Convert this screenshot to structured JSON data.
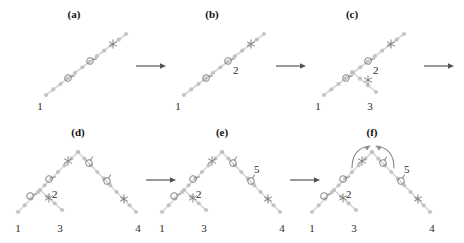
{
  "figure": {
    "title_visible": false,
    "background_color": "#ffffff",
    "branch_color": "#c9c9c9",
    "node_color": "#bdbdbd",
    "glyph_color": "#888888",
    "text_color": "#2a2a2a",
    "arrow_color": "#555555",
    "width": 464,
    "height": 243
  },
  "panels": [
    {
      "id": "a",
      "label": "(a)",
      "label_x": 74,
      "label_y": 8,
      "leaf_labels": [
        {
          "text": "1",
          "x": 40,
          "y": 100
        }
      ],
      "node_labels": [],
      "branches": [
        {
          "name": "trunk",
          "x1": 46,
          "y1": 95,
          "x2": 126,
          "y2": 34
        }
      ],
      "glyphs": [
        {
          "type": "circle-tail-glyph",
          "x": 68,
          "y": 78,
          "rot": 20
        },
        {
          "type": "circle-tail-glyph",
          "x": 90,
          "y": 61,
          "rot": 20
        },
        {
          "type": "star-glyph",
          "x": 113,
          "y": 44
        }
      ],
      "curved_arrows": []
    },
    {
      "id": "b",
      "label": "(b)",
      "label_x": 212,
      "label_y": 8,
      "leaf_labels": [
        {
          "text": "1",
          "x": 178,
          "y": 100
        }
      ],
      "node_labels": [
        {
          "text": "2",
          "x": 233,
          "y": 64
        }
      ],
      "branches": [
        {
          "name": "trunk",
          "x1": 184,
          "y1": 95,
          "x2": 264,
          "y2": 34
        }
      ],
      "glyphs": [
        {
          "type": "circle-tail-glyph",
          "x": 206,
          "y": 78,
          "rot": 20
        },
        {
          "type": "circle-tail-glyph",
          "x": 228,
          "y": 61,
          "rot": 20
        },
        {
          "type": "star-glyph",
          "x": 251,
          "y": 44
        }
      ],
      "curved_arrows": []
    },
    {
      "id": "c",
      "label": "(c)",
      "label_x": 352,
      "label_y": 8,
      "leaf_labels": [
        {
          "text": "1",
          "x": 318,
          "y": 100
        },
        {
          "text": "3",
          "x": 370,
          "y": 100
        }
      ],
      "node_labels": [
        {
          "text": "2",
          "x": 373,
          "y": 64
        }
      ],
      "branches": [
        {
          "name": "trunk",
          "x1": 324,
          "y1": 95,
          "x2": 404,
          "y2": 34
        },
        {
          "name": "side-branch-3",
          "x1": 352,
          "y1": 72,
          "x2": 376,
          "y2": 92
        }
      ],
      "glyphs": [
        {
          "type": "circle-tail-glyph",
          "x": 346,
          "y": 78,
          "rot": 20
        },
        {
          "type": "circle-tail-glyph",
          "x": 368,
          "y": 61,
          "rot": 20
        },
        {
          "type": "star-glyph",
          "x": 391,
          "y": 44
        },
        {
          "type": "star-glyph",
          "x": 368,
          "y": 80
        }
      ],
      "curved_arrows": []
    },
    {
      "id": "d",
      "label": "(d)",
      "label_x": 78,
      "label_y": 126,
      "leaf_labels": [
        {
          "text": "1",
          "x": 18,
          "y": 222
        },
        {
          "text": "3",
          "x": 60,
          "y": 222
        },
        {
          "text": "4",
          "x": 138,
          "y": 222
        }
      ],
      "node_labels": [
        {
          "text": "2",
          "x": 52,
          "y": 188
        }
      ],
      "branches": [
        {
          "name": "left-trunk",
          "x1": 18,
          "y1": 212,
          "x2": 78,
          "y2": 152
        },
        {
          "name": "right-trunk",
          "x1": 78,
          "y1": 152,
          "x2": 136,
          "y2": 212
        },
        {
          "name": "side-branch-3",
          "x1": 40,
          "y1": 190,
          "x2": 62,
          "y2": 210
        }
      ],
      "glyphs": [
        {
          "type": "circle-tail-glyph",
          "x": 30,
          "y": 196,
          "rot": 20
        },
        {
          "type": "circle-tail-glyph",
          "x": 49,
          "y": 179,
          "rot": 20
        },
        {
          "type": "star-glyph",
          "x": 68,
          "y": 161
        },
        {
          "type": "circle-tail-glyph",
          "x": 89,
          "y": 163,
          "rot": -20
        },
        {
          "type": "circle-tail-glyph",
          "x": 107,
          "y": 181,
          "rot": -20
        },
        {
          "type": "star-glyph",
          "x": 124,
          "y": 199
        },
        {
          "type": "star-glyph",
          "x": 49,
          "y": 198
        }
      ],
      "curved_arrows": []
    },
    {
      "id": "e",
      "label": "(e)",
      "label_x": 222,
      "label_y": 126,
      "leaf_labels": [
        {
          "text": "1",
          "x": 162,
          "y": 222
        },
        {
          "text": "3",
          "x": 204,
          "y": 222
        },
        {
          "text": "4",
          "x": 282,
          "y": 222
        }
      ],
      "node_labels": [
        {
          "text": "2",
          "x": 196,
          "y": 188
        },
        {
          "text": "5",
          "x": 254,
          "y": 163
        }
      ],
      "branches": [
        {
          "name": "left-trunk",
          "x1": 162,
          "y1": 212,
          "x2": 222,
          "y2": 152
        },
        {
          "name": "right-trunk",
          "x1": 222,
          "y1": 152,
          "x2": 280,
          "y2": 212
        },
        {
          "name": "side-branch-3",
          "x1": 184,
          "y1": 190,
          "x2": 206,
          "y2": 210
        }
      ],
      "glyphs": [
        {
          "type": "circle-tail-glyph",
          "x": 174,
          "y": 196,
          "rot": 20
        },
        {
          "type": "circle-tail-glyph",
          "x": 193,
          "y": 179,
          "rot": 20
        },
        {
          "type": "star-glyph",
          "x": 212,
          "y": 161
        },
        {
          "type": "circle-tail-glyph",
          "x": 233,
          "y": 163,
          "rot": -20
        },
        {
          "type": "circle-tail-glyph",
          "x": 251,
          "y": 181,
          "rot": -20
        },
        {
          "type": "star-glyph",
          "x": 268,
          "y": 199
        },
        {
          "type": "star-glyph",
          "x": 193,
          "y": 198
        }
      ],
      "curved_arrows": []
    },
    {
      "id": "f",
      "label": "(f)",
      "label_x": 372,
      "label_y": 126,
      "leaf_labels": [
        {
          "text": "1",
          "x": 312,
          "y": 222
        },
        {
          "text": "3",
          "x": 354,
          "y": 222
        },
        {
          "text": "4",
          "x": 432,
          "y": 222
        }
      ],
      "node_labels": [
        {
          "text": "2",
          "x": 346,
          "y": 188
        },
        {
          "text": "5",
          "x": 404,
          "y": 163
        }
      ],
      "branches": [
        {
          "name": "left-trunk",
          "x1": 312,
          "y1": 212,
          "x2": 372,
          "y2": 152
        },
        {
          "name": "right-trunk",
          "x1": 372,
          "y1": 152,
          "x2": 430,
          "y2": 212
        },
        {
          "name": "side-branch-3",
          "x1": 334,
          "y1": 190,
          "x2": 356,
          "y2": 210
        }
      ],
      "glyphs": [
        {
          "type": "circle-tail-glyph",
          "x": 324,
          "y": 196,
          "rot": 20
        },
        {
          "type": "circle-tail-glyph",
          "x": 343,
          "y": 179,
          "rot": 20
        },
        {
          "type": "star-glyph",
          "x": 362,
          "y": 161
        },
        {
          "type": "circle-tail-glyph",
          "x": 383,
          "y": 163,
          "rot": -20
        },
        {
          "type": "circle-tail-glyph",
          "x": 401,
          "y": 181,
          "rot": -20
        },
        {
          "type": "star-glyph",
          "x": 418,
          "y": 199
        },
        {
          "type": "star-glyph",
          "x": 343,
          "y": 198
        }
      ],
      "curved_arrows": [
        {
          "name": "left-curved-arrow",
          "d": "M 352 168 Q 352 148 370 146",
          "head_x": 370,
          "head_y": 146,
          "head_rot": -35
        },
        {
          "name": "right-curved-arrow",
          "d": "M 394 168 Q 394 148 376 146",
          "head_x": 376,
          "head_y": 146,
          "head_rot": 215
        }
      ]
    }
  ],
  "step_arrows": [
    {
      "name": "step-arrow-a-b",
      "x": 136,
      "y": 66,
      "length": 30
    },
    {
      "name": "step-arrow-b-c",
      "x": 276,
      "y": 66,
      "length": 30
    },
    {
      "name": "step-arrow-c-end",
      "x": 424,
      "y": 66,
      "length": 30
    },
    {
      "name": "step-arrow-d-e",
      "x": 146,
      "y": 180,
      "length": 30
    },
    {
      "name": "step-arrow-e-f",
      "x": 290,
      "y": 180,
      "length": 30
    }
  ]
}
